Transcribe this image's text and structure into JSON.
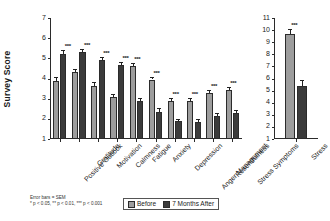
{
  "chart_data": {
    "type": "bar",
    "title": "",
    "ylabel": "Survey Score",
    "xlabel": "",
    "grid": false,
    "legend_position": "bottom-center",
    "legend": [
      "Before",
      "7 Months After"
    ],
    "panels": [
      {
        "name": "survey-panel",
        "ylim": [
          1,
          7
        ],
        "yticks": [
          1,
          2,
          3,
          4,
          5,
          6,
          7
        ],
        "categories": [
          "Positive Outlook",
          "Gratitude",
          "Motivation",
          "Calmness",
          "Fatigue",
          "Anxiety",
          "Depression",
          "Anger Management",
          "Resentfulness",
          "Stress Symptoms"
        ],
        "series": [
          {
            "name": "Before",
            "values": [
              3.9,
              4.3,
              3.65,
              3.1,
              4.62,
              3.95,
              2.9,
              2.9,
              3.3,
              3.45
            ],
            "errors": [
              0.17,
              0.16,
              0.2,
              0.14,
              0.13,
              0.12,
              0.13,
              0.14,
              0.12,
              0.12
            ]
          },
          {
            "name": "7 Months After",
            "values": [
              5.22,
              5.3,
              4.9,
              4.65,
              2.9,
              2.35,
              1.9,
              1.85,
              2.15,
              2.28
            ],
            "errors": [
              0.17,
              0.14,
              0.15,
              0.16,
              0.12,
              0.17,
              0.11,
              0.14,
              0.12,
              0.15
            ]
          }
        ],
        "significance": [
          "***",
          "***",
          "***",
          "***",
          "***",
          "***",
          "***",
          "***",
          "***",
          "***"
        ]
      },
      {
        "name": "stress-panel",
        "ylim": [
          1,
          11
        ],
        "yticks": [
          1,
          2,
          3,
          4,
          5,
          6,
          7,
          8,
          9,
          10,
          11
        ],
        "categories": [
          "Stress"
        ],
        "series": [
          {
            "name": "Before",
            "values": [
              9.7
            ],
            "errors": [
              0.42
            ]
          },
          {
            "name": "7 Months After",
            "values": [
              5.35
            ],
            "errors": [
              0.52
            ]
          }
        ],
        "significance": [
          "***"
        ]
      }
    ],
    "annotations": {
      "error_note": "Error bars = SEM",
      "p_note": "* p < 0.05, ** p < 0.01, *** p < 0.001"
    },
    "colors": {
      "before": "#9d9d9d",
      "after": "#3b3b3b",
      "axis": "#2b2b2b"
    }
  }
}
